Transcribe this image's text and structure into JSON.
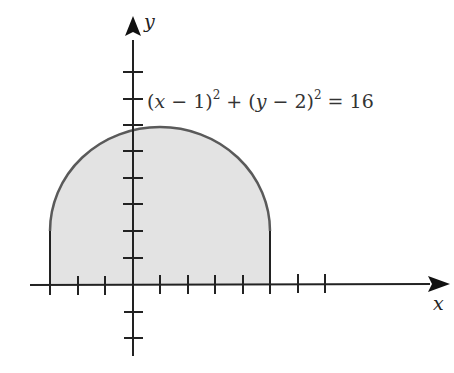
{
  "diagram": {
    "axes": {
      "x_label": "x",
      "y_label": "y",
      "x_ticks": [
        -3,
        -2,
        -1,
        1,
        2,
        3,
        4,
        5,
        6,
        7
      ],
      "y_ticks": [
        -2,
        -1,
        1,
        2,
        3,
        4,
        5,
        6,
        7,
        8
      ]
    },
    "equation": {
      "text": "(x − 1)² + (y − 2)² = 16",
      "parts": [
        "(",
        "x",
        " − 1)",
        "2",
        " + (",
        "y",
        " − 2)",
        "2",
        " = 16"
      ]
    },
    "circle": {
      "center": [
        1,
        2
      ],
      "radius": 4
    },
    "region": {
      "description": "Shaded region: upper half of circle (y ≥ 2) plus rectangle from x=-3 to x=5, y=0 to y=2",
      "x_range": [
        -3,
        5
      ],
      "y_range": [
        0,
        6
      ]
    },
    "colors": {
      "fill": "#e3e3e3",
      "curve": "#555555",
      "axis": "#111111"
    }
  }
}
